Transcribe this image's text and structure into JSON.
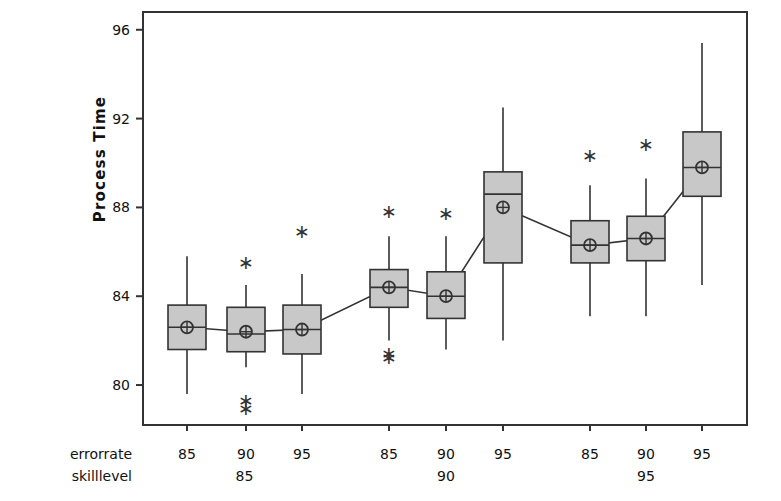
{
  "chart_data": {
    "type": "box",
    "title": "",
    "ylabel": "Process Time",
    "xlabel": "",
    "ylim": [
      78.2,
      96.8
    ],
    "yticks": [
      80,
      84,
      88,
      92,
      96
    ],
    "ytick_labels": [
      "80",
      "84",
      "88",
      "92",
      "96"
    ],
    "grid": false,
    "legend": false,
    "axis_rows": [
      {
        "name": "errorrate",
        "labels": [
          "85",
          "90",
          "95",
          "85",
          "90",
          "95",
          "85",
          "90",
          "95"
        ]
      },
      {
        "name": "skilllevel",
        "labels": [
          "85",
          "90",
          "95"
        ]
      }
    ],
    "marker_note": "circle-plus = group mean, asterisk = outlier, line connects means",
    "groups": [
      {
        "skilllevel": "85",
        "boxes": [
          {
            "errorrate": "85",
            "whisker_low": 79.6,
            "q1": 81.6,
            "median": 82.6,
            "q3": 83.6,
            "whisker_high": 85.8,
            "mean": 82.6,
            "outliers": []
          },
          {
            "errorrate": "90",
            "whisker_low": 80.8,
            "q1": 81.5,
            "median": 82.3,
            "q3": 83.5,
            "whisker_high": 84.5,
            "mean": 82.4,
            "outliers": [
              85.5,
              79.3,
              78.9
            ]
          },
          {
            "errorrate": "95",
            "whisker_low": 79.6,
            "q1": 81.4,
            "median": 82.5,
            "q3": 83.6,
            "whisker_high": 85.0,
            "mean": 82.5,
            "outliers": [
              86.9
            ]
          }
        ]
      },
      {
        "skilllevel": "90",
        "boxes": [
          {
            "errorrate": "85",
            "whisker_low": 82.0,
            "q1": 83.5,
            "median": 84.4,
            "q3": 85.2,
            "whisker_high": 86.7,
            "mean": 84.4,
            "outliers": [
              87.8,
              81.4,
              81.2
            ]
          },
          {
            "errorrate": "90",
            "whisker_low": 81.6,
            "q1": 83.0,
            "median": 84.0,
            "q3": 85.1,
            "whisker_high": 86.7,
            "mean": 84.0,
            "outliers": [
              87.7
            ]
          },
          {
            "errorrate": "95",
            "whisker_low": 82.0,
            "q1": 85.5,
            "median": 88.6,
            "q3": 89.6,
            "whisker_high": 92.5,
            "mean": 88.0,
            "outliers": []
          }
        ]
      },
      {
        "skilllevel": "95",
        "boxes": [
          {
            "errorrate": "85",
            "whisker_low": 83.1,
            "q1": 85.5,
            "median": 86.3,
            "q3": 87.4,
            "whisker_high": 89.0,
            "mean": 86.3,
            "outliers": [
              90.3
            ]
          },
          {
            "errorrate": "90",
            "whisker_low": 83.1,
            "q1": 85.6,
            "median": 86.6,
            "q3": 87.6,
            "whisker_high": 89.3,
            "mean": 86.6,
            "outliers": [
              90.8
            ]
          },
          {
            "errorrate": "95",
            "whisker_low": 84.5,
            "q1": 88.5,
            "median": 89.8,
            "q3": 91.4,
            "whisker_high": 95.4,
            "mean": 89.8,
            "outliers": []
          }
        ]
      }
    ],
    "mean_line": [
      82.6,
      82.4,
      82.5,
      84.4,
      84.0,
      88.0,
      86.3,
      86.6,
      89.8
    ],
    "colors": {
      "box_fill": "#c8c8c8",
      "box_stroke": "#333333",
      "whisker": "#333333",
      "axis": "#333333",
      "text": "#111111"
    }
  }
}
